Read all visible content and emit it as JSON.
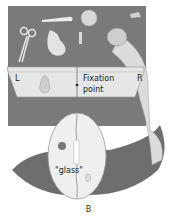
{
  "figure": {
    "screen": {
      "left_label": "L",
      "right_label": "R",
      "fixation_label_line1": "Fixation",
      "fixation_label_line2": "point"
    },
    "brain": {
      "word_label": "\"glass\""
    },
    "objects": [
      "scissors",
      "pear",
      "spoon",
      "coin",
      "key",
      "glass",
      "pear (screen image)"
    ],
    "caption": "B",
    "colors": {
      "board": "#7a7a7a",
      "body": "#6e6e6e",
      "screen": "#e6e6e6"
    }
  }
}
